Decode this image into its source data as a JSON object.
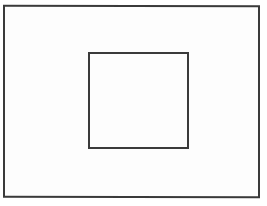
{
  "diagram": {
    "shapes": [
      {
        "id": "outer-rectangle",
        "type": "rectangle",
        "stroke": "#3a3a3a",
        "fill": "#fdfdfd"
      },
      {
        "id": "inner-square",
        "type": "rectangle",
        "stroke": "#3a3a3a",
        "fill": "#fdfdfd"
      }
    ]
  }
}
